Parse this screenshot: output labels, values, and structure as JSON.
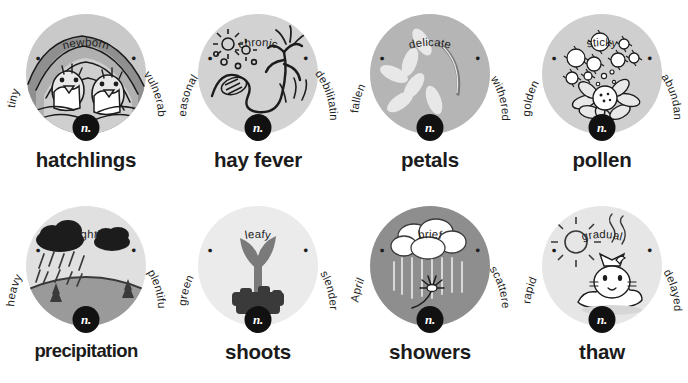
{
  "page": {
    "columns": 4,
    "rows": 2,
    "background": "#ffffff",
    "text_color": "#1b1b1b",
    "badge_color": "#111111",
    "badge_text_color": "#ffffff"
  },
  "entries": [
    {
      "headword": "hatchlings",
      "pos": "n.",
      "adjectives": [
        "tiny",
        "newborn",
        "vulnerable"
      ],
      "illustration": "birds-in-nest",
      "disc_color": "#c9c9c9",
      "wide": false
    },
    {
      "headword": "hay fever",
      "pos": "n.",
      "adjectives": [
        "seasonal",
        "chronic",
        "debilitating"
      ],
      "illustration": "wilting-plant-sneeze",
      "disc_color": "#d2d2d2",
      "wide": false
    },
    {
      "headword": "petals",
      "pos": "n.",
      "adjectives": [
        "fallen",
        "delicate",
        "withered"
      ],
      "illustration": "falling-petals",
      "disc_color": "#b5b5b5",
      "wide": false
    },
    {
      "headword": "pollen",
      "pos": "n.",
      "adjectives": [
        "golden",
        "sticky",
        "abundant"
      ],
      "illustration": "daisy-with-pollen",
      "disc_color": "#cfcfcf",
      "wide": false
    },
    {
      "headword": "precipitation",
      "pos": "n.",
      "adjectives": [
        "heavy",
        "light",
        "plentiful"
      ],
      "illustration": "rain-clouds-over-hill",
      "disc_color": "#e0e0e0",
      "wide": true
    },
    {
      "headword": "shoots",
      "pos": "n.",
      "adjectives": [
        "green",
        "leafy",
        "slender"
      ],
      "illustration": "sprout-in-soil",
      "disc_color": "#ebebeb",
      "wide": false
    },
    {
      "headword": "showers",
      "pos": "n.",
      "adjectives": [
        "April",
        "brief",
        "scattered"
      ],
      "illustration": "rain-cloud-over-flower",
      "disc_color": "#8e8e8e",
      "wide": false
    },
    {
      "headword": "thaw",
      "pos": "n.",
      "adjectives": [
        "rapid",
        "gradual",
        "delayed"
      ],
      "illustration": "cat-melting-snow-sun",
      "disc_color": "#e6e6e6",
      "wide": false
    }
  ],
  "separator_dot": "•"
}
